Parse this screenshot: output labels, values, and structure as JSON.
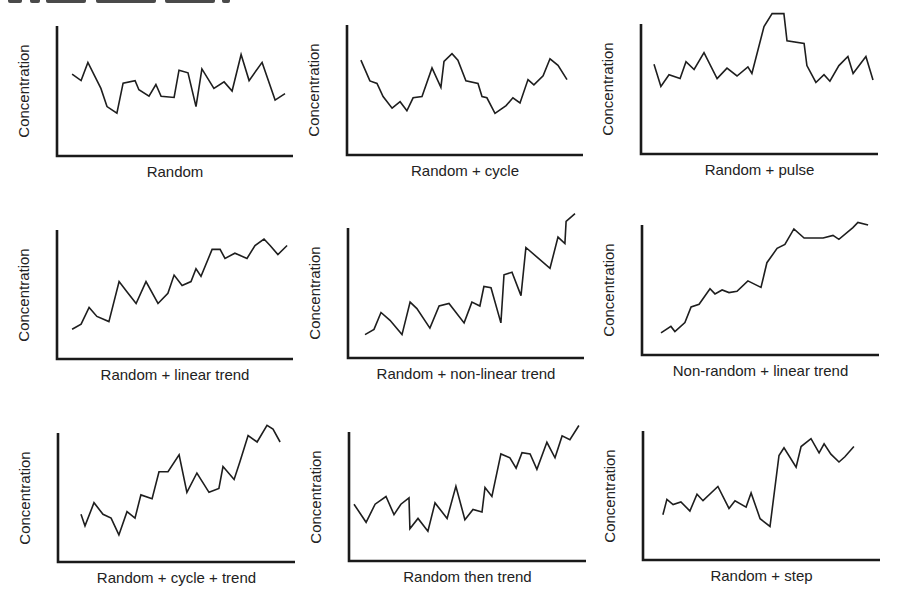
{
  "figure": {
    "y_axis_label": "Concentration",
    "line_color": "#1e1e1e",
    "axis_color": "#1a1a1a",
    "background": "#ffffff"
  },
  "panels": [
    {
      "label": "Random"
    },
    {
      "label": "Random + cycle"
    },
    {
      "label": "Random + pulse"
    },
    {
      "label": "Random + linear trend"
    },
    {
      "label": "Random + non-linear trend"
    },
    {
      "label": "Non-random + linear trend"
    },
    {
      "label": "Random + cycle + trend"
    },
    {
      "label": "Random then trend"
    },
    {
      "label": "Random + step"
    }
  ],
  "chart_data": [
    {
      "type": "line",
      "title": "Random",
      "xlabel": "Random",
      "ylabel": "Concentration",
      "xlim": [
        0,
        100
      ],
      "ylim": [
        0,
        100
      ],
      "grid": false,
      "ticks": false,
      "x": [
        6.4,
        10.2,
        13.1,
        16.1,
        18.6,
        21.2,
        25.4,
        28.0,
        33.1,
        34.7,
        39.0,
        41.9,
        44.1,
        49.6,
        51.7,
        55.5,
        58.9,
        61.4,
        66.5,
        70.8,
        74.2,
        78.0,
        81.4,
        86.9,
        92.4,
        96.6
      ],
      "y": [
        63,
        58,
        72,
        61,
        52,
        38,
        33,
        56,
        58,
        51,
        46,
        55,
        46,
        45,
        66,
        64,
        38,
        67,
        52,
        57,
        50,
        78,
        58,
        72,
        43,
        48
      ]
    },
    {
      "type": "line",
      "title": "Random + cycle",
      "xlabel": "Random + cycle",
      "ylabel": "Concentration",
      "xlim": [
        0,
        100
      ],
      "ylim": [
        0,
        100
      ],
      "grid": false,
      "ticks": false,
      "x": [
        5.9,
        9.7,
        12.7,
        15.3,
        19.1,
        22.5,
        25.4,
        28.0,
        31.8,
        36.0,
        39.8,
        41.1,
        44.5,
        47.0,
        50.4,
        55.5,
        57.2,
        59.3,
        62.7,
        67.4,
        70.3,
        73.3,
        76.7,
        79.2,
        83.1,
        86.0,
        89.4,
        93.2
      ],
      "y": [
        73,
        57,
        55,
        45,
        36,
        41,
        34,
        44,
        45,
        67,
        52,
        72,
        78,
        73,
        57,
        55,
        45,
        44,
        32,
        38,
        44,
        40,
        58,
        54,
        61,
        74,
        69,
        58
      ]
    },
    {
      "type": "line",
      "title": "Random + pulse",
      "xlabel": "Random + pulse",
      "ylabel": "Concentration",
      "xlim": [
        0,
        100
      ],
      "ylim": [
        0,
        100
      ],
      "grid": false,
      "ticks": false,
      "x": [
        5.5,
        8.4,
        11.8,
        16.5,
        19.0,
        22.4,
        26.6,
        32.1,
        36.3,
        40.5,
        45.1,
        46.8,
        51.9,
        55.3,
        60.3,
        61.6,
        68.8,
        70.0,
        73.8,
        77.2,
        79.7,
        83.5,
        87.3,
        89.5,
        94.9,
        97.9
      ],
      "y": [
        69,
        52,
        61,
        58,
        71,
        65,
        78,
        58,
        66,
        60,
        67,
        62,
        98,
        108,
        108,
        87,
        85,
        68,
        55,
        61,
        56,
        68,
        75,
        62,
        75,
        57
      ]
    },
    {
      "type": "line",
      "title": "Random + linear trend",
      "xlabel": "Random + linear trend",
      "ylabel": "Concentration",
      "xlim": [
        0,
        100
      ],
      "ylim": [
        0,
        100
      ],
      "grid": false,
      "ticks": false,
      "x": [
        6.4,
        10.2,
        13.6,
        16.9,
        22.0,
        26.3,
        29.7,
        33.5,
        37.7,
        42.8,
        47.0,
        49.6,
        53.0,
        56.8,
        58.9,
        61.0,
        65.7,
        69.1,
        71.2,
        75.4,
        80.5,
        83.9,
        87.7,
        90.3,
        93.6,
        97.5
      ],
      "y": [
        23,
        27,
        40,
        33,
        29,
        60,
        52,
        43,
        60,
        43,
        51,
        65,
        57,
        60,
        70,
        64,
        85,
        85,
        78,
        82,
        78,
        88,
        93,
        88,
        81,
        88
      ]
    },
    {
      "type": "line",
      "title": "Random + non-linear trend",
      "xlabel": "Random + non-linear trend",
      "ylabel": "Concentration",
      "xlim": [
        0,
        100
      ],
      "ylim": [
        0,
        100
      ],
      "grid": false,
      "ticks": false,
      "x": [
        7.2,
        11.0,
        14.0,
        17.8,
        22.9,
        26.3,
        29.2,
        34.7,
        38.6,
        42.8,
        49.2,
        52.5,
        55.9,
        57.6,
        60.6,
        64.8,
        66.1,
        69.5,
        73.3,
        75.4,
        85.6,
        89.0,
        91.9,
        92.4,
        96.2
      ],
      "y": [
        18,
        22,
        35,
        29,
        18,
        43,
        38,
        23,
        40,
        42,
        27,
        43,
        40,
        55,
        54,
        27,
        64,
        66,
        48,
        85,
        69,
        93,
        88,
        105,
        111
      ]
    },
    {
      "type": "line",
      "title": "Non-random + linear trend",
      "xlabel": "Non-random + linear trend",
      "ylabel": "Concentration",
      "xlim": [
        0,
        100
      ],
      "ylim": [
        0,
        100
      ],
      "grid": false,
      "ticks": false,
      "x": [
        8.0,
        12.2,
        13.9,
        18.1,
        20.7,
        24.1,
        28.7,
        30.8,
        33.8,
        36.7,
        40.1,
        44.7,
        50.2,
        52.7,
        57.0,
        60.3,
        64.1,
        68.4,
        76.4,
        80.6,
        83.1,
        89.0,
        91.1,
        95.4
      ],
      "y": [
        17,
        22,
        18,
        25,
        37,
        39,
        51,
        47,
        50,
        48,
        49,
        57,
        52,
        71,
        82,
        85,
        97,
        90,
        90,
        92,
        89,
        98,
        102,
        100
      ]
    },
    {
      "type": "line",
      "title": "Random + cycle + trend",
      "xlabel": "Random + cycle + trend",
      "ylabel": "Concentration",
      "xlim": [
        0,
        100
      ],
      "ylim": [
        0,
        100
      ],
      "grid": false,
      "ticks": false,
      "x": [
        9.7,
        11.4,
        15.2,
        19.0,
        22.4,
        25.7,
        29.1,
        32.5,
        35.0,
        39.7,
        42.6,
        46.4,
        51.1,
        54.4,
        58.6,
        63.7,
        67.9,
        69.6,
        74.3,
        76.8,
        80.2,
        84.0,
        88.2,
        90.7,
        93.7
      ],
      "y": [
        37,
        28,
        46,
        37,
        34,
        21,
        39,
        34,
        52,
        49,
        70,
        70,
        83,
        54,
        69,
        54,
        57,
        74,
        64,
        78,
        98,
        93,
        106,
        103,
        93
      ]
    },
    {
      "type": "line",
      "title": "Random then trend",
      "xlabel": "Random then trend",
      "ylabel": "Concentration",
      "xlim": [
        0,
        100
      ],
      "ylim": [
        0,
        100
      ],
      "grid": false,
      "ticks": false,
      "x": [
        2.1,
        7.2,
        11.0,
        15.6,
        19.0,
        21.9,
        25.3,
        25.7,
        29.1,
        33.3,
        36.3,
        41.4,
        45.1,
        48.9,
        52.3,
        56.1,
        57.4,
        60.3,
        64.1,
        67.9,
        70.5,
        73.0,
        76.4,
        79.3,
        83.5,
        86.9,
        89.9,
        93.2,
        97.0
      ],
      "y": [
        44,
        30,
        44,
        50,
        36,
        44,
        49,
        25,
        33,
        23,
        45,
        33,
        58,
        32,
        40,
        38,
        57,
        50,
        83,
        80,
        72,
        84,
        83,
        71,
        92,
        80,
        97,
        94,
        105
      ]
    },
    {
      "type": "line",
      "title": "Random + step",
      "xlabel": "Random + step",
      "ylabel": "Concentration",
      "xlim": [
        0,
        100
      ],
      "ylim": [
        0,
        100
      ],
      "grid": false,
      "ticks": false,
      "x": [
        8.4,
        10.1,
        12.7,
        16.0,
        19.8,
        22.8,
        25.3,
        31.6,
        36.3,
        38.8,
        43.5,
        45.6,
        49.4,
        53.6,
        57.4,
        59.5,
        64.6,
        66.7,
        70.9,
        74.3,
        76.4,
        79.3,
        82.7,
        85.2,
        89.0
      ],
      "y": [
        35,
        47,
        43,
        45,
        38,
        51,
        46,
        57,
        40,
        46,
        41,
        52,
        32,
        26,
        81,
        87,
        72,
        88,
        94,
        83,
        90,
        82,
        76,
        80,
        88
      ]
    }
  ]
}
